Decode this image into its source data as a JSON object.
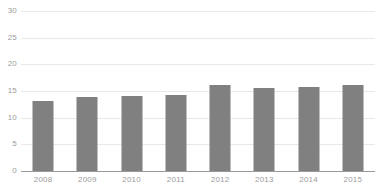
{
  "chart_data": {
    "type": "bar",
    "title": "",
    "subtitle": "",
    "xlabel": "",
    "ylabel": "",
    "categories": [
      "2008",
      "2009",
      "2010",
      "2011",
      "2012",
      "2013",
      "2014",
      "2015"
    ],
    "values": [
      13.1,
      13.9,
      14.0,
      14.2,
      16.1,
      15.5,
      15.7,
      16.2
    ],
    "series": [
      {
        "name": "",
        "values": [
          13.1,
          13.9,
          14.0,
          14.2,
          16.1,
          15.5,
          15.7,
          16.2
        ]
      }
    ],
    "ylim": [
      0,
      30
    ],
    "yticks": [
      0,
      5,
      10,
      15,
      20,
      25,
      30
    ],
    "ytick_labels": [
      "0",
      "5",
      "10",
      "15",
      "20",
      "25",
      "30"
    ],
    "grid": true,
    "legend": false,
    "legend_position": "none",
    "annotations": []
  },
  "colors": {
    "bar": "#808080",
    "gridline": "#e8e8e8",
    "baseline": "#9a9a9a",
    "tick_label": "#9b9b9b",
    "background": "#ffffff"
  }
}
